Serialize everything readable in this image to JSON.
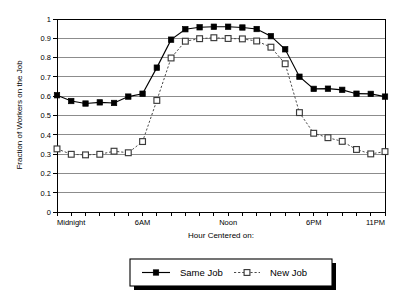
{
  "chart_data": {
    "type": "line",
    "title": "",
    "xlabel": "Hour Centered on:",
    "ylabel": "Fraction of Workers on the Job",
    "xlim": [
      0,
      23
    ],
    "ylim": [
      0,
      1
    ],
    "grid": true,
    "legend_position": "bottom-center",
    "y_ticks": [
      0,
      0.1,
      0.2,
      0.3,
      0.4,
      0.5,
      0.6,
      0.7,
      0.8,
      0.9,
      1
    ],
    "y_tick_labels": [
      "0",
      "0.1",
      "0.2",
      "0.3",
      "0.4",
      "0.5",
      "0.6",
      "0.7",
      "0.8",
      "0.9",
      "1"
    ],
    "x": [
      0,
      1,
      2,
      3,
      4,
      5,
      6,
      7,
      8,
      9,
      10,
      11,
      12,
      13,
      14,
      15,
      16,
      17,
      18,
      19,
      20,
      21,
      22,
      23
    ],
    "x_tick_positions": [
      0,
      6,
      12,
      18,
      23
    ],
    "x_tick_labels": [
      "Midnight",
      "6AM",
      "Noon",
      "6PM",
      "11PM"
    ],
    "series": [
      {
        "name": "Same Job",
        "marker": "filled-square",
        "linestyle": "solid",
        "color": "#000000",
        "values": [
          0.605,
          0.575,
          0.562,
          0.568,
          0.565,
          0.598,
          0.613,
          0.748,
          0.893,
          0.947,
          0.957,
          0.96,
          0.96,
          0.956,
          0.948,
          0.911,
          0.843,
          0.701,
          0.638,
          0.639,
          0.633,
          0.613,
          0.612,
          0.598
        ]
      },
      {
        "name": "New Job",
        "marker": "open-square",
        "linestyle": "dashed",
        "color": "#4a4a4a",
        "values": [
          0.327,
          0.299,
          0.296,
          0.299,
          0.315,
          0.307,
          0.365,
          0.578,
          0.798,
          0.885,
          0.898,
          0.903,
          0.899,
          0.897,
          0.886,
          0.854,
          0.768,
          0.515,
          0.408,
          0.385,
          0.366,
          0.324,
          0.301,
          0.313
        ]
      }
    ]
  },
  "legend": {
    "entries": [
      {
        "label": "Same Job"
      },
      {
        "label": "New Job"
      }
    ]
  }
}
